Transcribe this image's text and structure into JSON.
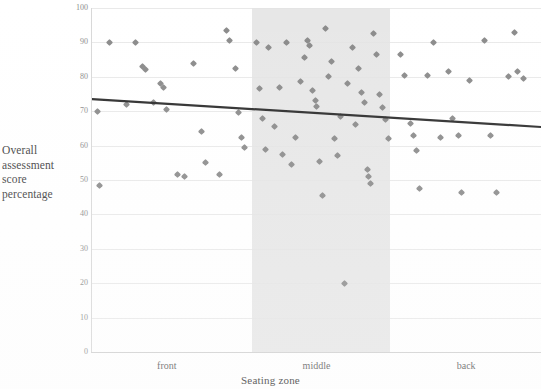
{
  "chart_data": {
    "type": "scatter",
    "title": "",
    "xlabel": "Seating zone",
    "ylabel": "Overall assessment score percentage",
    "ylabel_lines": [
      "Overall",
      "assessment",
      "score",
      "percentage"
    ],
    "xlim": [
      0,
      3
    ],
    "ylim": [
      0,
      100
    ],
    "grid": true,
    "legend": "none",
    "categories": [
      "front",
      "middle",
      "back"
    ],
    "xticks": [
      {
        "label": "front",
        "pos": 0.5
      },
      {
        "label": "middle",
        "pos": 1.5
      },
      {
        "label": "back",
        "pos": 2.5
      }
    ],
    "yticks": [
      0,
      10,
      20,
      30,
      40,
      50,
      60,
      70,
      80,
      90,
      100
    ],
    "shaded_band": {
      "label": "middle",
      "x_start": 1.07,
      "x_end": 1.99,
      "color": "#e3e3e3"
    },
    "marker": {
      "shape": "diamond",
      "color": "#8a8a8a",
      "size": 5
    },
    "trendline": {
      "color": "#2b2b2b",
      "width": 2.2,
      "x_start": 0.0,
      "y_start": 73.5,
      "x_end": 3.0,
      "y_end": 65.4
    },
    "series": [
      {
        "name": "Overall assessment score percentage",
        "points": [
          {
            "x": 0.04,
            "y": 70.0
          },
          {
            "x": 0.05,
            "y": 48.5
          },
          {
            "x": 0.12,
            "y": 90.0
          },
          {
            "x": 0.23,
            "y": 72.0
          },
          {
            "x": 0.29,
            "y": 90.0
          },
          {
            "x": 0.34,
            "y": 83.0
          },
          {
            "x": 0.36,
            "y": 82.0
          },
          {
            "x": 0.41,
            "y": 72.5
          },
          {
            "x": 0.46,
            "y": 78.0
          },
          {
            "x": 0.48,
            "y": 77.0
          },
          {
            "x": 0.5,
            "y": 70.5
          },
          {
            "x": 0.57,
            "y": 51.5
          },
          {
            "x": 0.62,
            "y": 51.0
          },
          {
            "x": 0.68,
            "y": 84.0
          },
          {
            "x": 0.73,
            "y": 64.0
          },
          {
            "x": 0.76,
            "y": 55.0
          },
          {
            "x": 0.85,
            "y": 51.5
          },
          {
            "x": 0.9,
            "y": 93.5
          },
          {
            "x": 0.92,
            "y": 90.5
          },
          {
            "x": 0.96,
            "y": 82.5
          },
          {
            "x": 0.98,
            "y": 69.5
          },
          {
            "x": 1.0,
            "y": 62.5
          },
          {
            "x": 1.02,
            "y": 59.5
          },
          {
            "x": 1.1,
            "y": 90.0
          },
          {
            "x": 1.12,
            "y": 76.5
          },
          {
            "x": 1.14,
            "y": 68.0
          },
          {
            "x": 1.16,
            "y": 59.0
          },
          {
            "x": 1.18,
            "y": 88.5
          },
          {
            "x": 1.22,
            "y": 65.5
          },
          {
            "x": 1.25,
            "y": 77.0
          },
          {
            "x": 1.27,
            "y": 57.5
          },
          {
            "x": 1.3,
            "y": 90.0
          },
          {
            "x": 1.33,
            "y": 54.5
          },
          {
            "x": 1.36,
            "y": 62.5
          },
          {
            "x": 1.39,
            "y": 78.5
          },
          {
            "x": 1.42,
            "y": 85.5
          },
          {
            "x": 1.44,
            "y": 90.5
          },
          {
            "x": 1.45,
            "y": 89.0
          },
          {
            "x": 1.47,
            "y": 76.0
          },
          {
            "x": 1.49,
            "y": 73.0
          },
          {
            "x": 1.5,
            "y": 71.5
          },
          {
            "x": 1.52,
            "y": 55.5
          },
          {
            "x": 1.54,
            "y": 45.5
          },
          {
            "x": 1.56,
            "y": 94.0
          },
          {
            "x": 1.58,
            "y": 80.0
          },
          {
            "x": 1.6,
            "y": 84.5
          },
          {
            "x": 1.62,
            "y": 62.0
          },
          {
            "x": 1.64,
            "y": 57.0
          },
          {
            "x": 1.66,
            "y": 68.5
          },
          {
            "x": 1.69,
            "y": 20.0
          },
          {
            "x": 1.71,
            "y": 78.0
          },
          {
            "x": 1.74,
            "y": 88.5
          },
          {
            "x": 1.76,
            "y": 66.0
          },
          {
            "x": 1.78,
            "y": 82.5
          },
          {
            "x": 1.8,
            "y": 75.5
          },
          {
            "x": 1.82,
            "y": 72.5
          },
          {
            "x": 1.84,
            "y": 53.0
          },
          {
            "x": 1.85,
            "y": 51.0
          },
          {
            "x": 1.86,
            "y": 49.0
          },
          {
            "x": 1.88,
            "y": 92.5
          },
          {
            "x": 1.9,
            "y": 86.5
          },
          {
            "x": 1.92,
            "y": 75.0
          },
          {
            "x": 1.94,
            "y": 71.0
          },
          {
            "x": 1.96,
            "y": 67.5
          },
          {
            "x": 1.98,
            "y": 62.0
          },
          {
            "x": 2.06,
            "y": 86.5
          },
          {
            "x": 2.09,
            "y": 80.5
          },
          {
            "x": 2.13,
            "y": 66.5
          },
          {
            "x": 2.15,
            "y": 63.0
          },
          {
            "x": 2.17,
            "y": 58.5
          },
          {
            "x": 2.19,
            "y": 47.5
          },
          {
            "x": 2.24,
            "y": 80.5
          },
          {
            "x": 2.28,
            "y": 90.0
          },
          {
            "x": 2.33,
            "y": 62.5
          },
          {
            "x": 2.38,
            "y": 81.5
          },
          {
            "x": 2.41,
            "y": 68.0
          },
          {
            "x": 2.45,
            "y": 63.0
          },
          {
            "x": 2.47,
            "y": 46.5
          },
          {
            "x": 2.52,
            "y": 79.0
          },
          {
            "x": 2.62,
            "y": 90.5
          },
          {
            "x": 2.66,
            "y": 63.0
          },
          {
            "x": 2.7,
            "y": 46.5
          },
          {
            "x": 2.78,
            "y": 80.0
          },
          {
            "x": 2.82,
            "y": 93.0
          },
          {
            "x": 2.84,
            "y": 81.5
          },
          {
            "x": 2.88,
            "y": 79.5
          }
        ]
      }
    ]
  }
}
